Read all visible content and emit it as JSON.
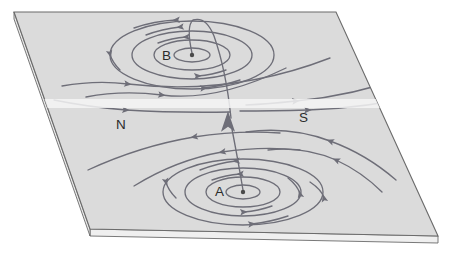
{
  "figure": {
    "domain": "physics-diagram",
    "background_color": "#ffffff",
    "slab": {
      "top_face_color": "#dbdbdb",
      "side_face_color": "#e9e9e9",
      "front_face_color": "#efefef",
      "edge_color": "#6b6b6b",
      "thickness_px": 7,
      "corners": {
        "top_left": [
          14,
          12
        ],
        "top_right": [
          336,
          12
        ],
        "bottom_right": [
          438,
          236
        ],
        "bottom_left": [
          90,
          229
        ]
      }
    },
    "line_color": "#6e6e78",
    "arrow_color": "#6e6e78",
    "scan_band": {
      "color": "#f4f4f4",
      "y_top": 99,
      "height": 9
    }
  },
  "labels": [
    {
      "id": "label-b",
      "text": "B",
      "x": 162,
      "y": 60,
      "describes": "upper pole center label"
    },
    {
      "id": "label-a",
      "text": "A",
      "x": 215,
      "y": 196,
      "describes": "lower pole center label"
    },
    {
      "id": "label-n",
      "text": "N",
      "x": 116,
      "y": 129,
      "describes": "north polarity region"
    },
    {
      "id": "label-s",
      "text": "S",
      "x": 299,
      "y": 122,
      "describes": "south polarity region"
    }
  ],
  "poles": [
    {
      "id": "pole-b",
      "label": "B",
      "center": [
        192,
        55
      ],
      "dot_radius": 2.2,
      "rings": [
        {
          "rx": 18,
          "ry": 7
        },
        {
          "rx": 38,
          "ry": 15
        },
        {
          "rx": 60,
          "ry": 24
        },
        {
          "rx": 82,
          "ry": 34
        }
      ]
    },
    {
      "id": "pole-a",
      "label": "A",
      "center": [
        243,
        192
      ],
      "dot_radius": 2.2,
      "rings": [
        {
          "rx": 17,
          "ry": 7
        },
        {
          "rx": 37,
          "ry": 15
        },
        {
          "rx": 58,
          "ry": 24
        },
        {
          "rx": 80,
          "ry": 33
        }
      ]
    }
  ],
  "flux_tube": {
    "id": "flux-tube",
    "description": "field line rising from pole A, arcing over and descending into pole B",
    "arrowhead": {
      "x": 228,
      "y": 120,
      "direction": "up",
      "size": 9
    }
  },
  "field_arcs": [
    {
      "id": "arc-upper-left-1",
      "arrow_direction": "left"
    },
    {
      "id": "arc-upper-left-2",
      "arrow_direction": "left"
    },
    {
      "id": "arc-upper-right-1",
      "arrow_direction": "left"
    },
    {
      "id": "arc-upper-right-2",
      "arrow_direction": "left"
    },
    {
      "id": "arc-lower-left-1",
      "arrow_direction": "right"
    },
    {
      "id": "arc-lower-left-2",
      "arrow_direction": "right"
    },
    {
      "id": "arc-lower-right-1",
      "arrow_direction": "right"
    },
    {
      "id": "arc-lower-right-2",
      "arrow_direction": "right"
    }
  ]
}
